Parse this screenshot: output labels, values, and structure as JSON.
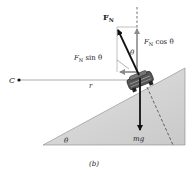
{
  "diagram": {
    "caption": "(b)",
    "labels": {
      "normal_force": "F",
      "normal_force_sub": "N",
      "vertical_component": "F",
      "vertical_component_sub": "N",
      "vertical_component_suffix": " cos θ",
      "horizontal_component": "F",
      "horizontal_component_sub": "N",
      "horizontal_component_suffix": " sin θ",
      "angle_at_car": "θ",
      "angle_at_base": "θ",
      "center_point": "C",
      "radius": "r",
      "weight": "mg"
    },
    "colors": {
      "incline_fill": "#d6d6d6",
      "arrow_dark": "#111111",
      "arrow_gray": "#8a8a8a",
      "line": "#555555"
    }
  }
}
